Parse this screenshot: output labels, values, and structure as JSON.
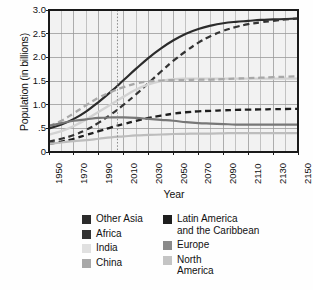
{
  "chart_data": {
    "type": "line",
    "title": "",
    "xlabel": "Year",
    "ylabel": "Population (in billions)",
    "xlim": [
      1950,
      2150
    ],
    "ylim": [
      0,
      3.0
    ],
    "grid": true,
    "legend_position": "bottom",
    "x_ticks": [
      "1950",
      "1970",
      "1990",
      "2010",
      "2030",
      "2050",
      "2070",
      "2090",
      "2110",
      "2130",
      "2150"
    ],
    "x_tick_values": [
      1950,
      1970,
      1990,
      2010,
      2030,
      2050,
      2070,
      2090,
      2110,
      2130,
      2150
    ],
    "x_minor_step": 10,
    "y_ticks": [
      "0",
      ".5",
      "1.0",
      "1.5",
      "2.0",
      "2.5",
      "3.0"
    ],
    "y_tick_values": [
      0,
      0.5,
      1.0,
      1.5,
      2.0,
      2.5,
      3.0
    ],
    "annotations": [
      {
        "name": "present-year-marker",
        "type": "vline",
        "x": 2005,
        "style": "dotted"
      }
    ],
    "x": [
      1950,
      1960,
      1970,
      1980,
      1990,
      2000,
      2010,
      2020,
      2030,
      2040,
      2050,
      2060,
      2070,
      2080,
      2090,
      2100,
      2110,
      2120,
      2130,
      2140,
      2150
    ],
    "series": [
      {
        "name": "Other Asia",
        "color": "#2b2b2b",
        "style": "solid",
        "width": 2.2,
        "values": [
          0.5,
          0.58,
          0.7,
          0.86,
          1.06,
          1.28,
          1.52,
          1.76,
          1.99,
          2.19,
          2.36,
          2.5,
          2.6,
          2.67,
          2.72,
          2.75,
          2.77,
          2.79,
          2.8,
          2.81,
          2.82
        ]
      },
      {
        "name": "Africa",
        "color": "#333333",
        "style": "dashed",
        "width": 2.2,
        "values": [
          0.22,
          0.28,
          0.36,
          0.47,
          0.62,
          0.8,
          1.0,
          1.22,
          1.46,
          1.7,
          1.93,
          2.13,
          2.31,
          2.45,
          2.56,
          2.64,
          2.7,
          2.74,
          2.77,
          2.8,
          2.82
        ]
      },
      {
        "name": "India",
        "color": "#d2d2d2",
        "style": "solid",
        "width": 2.4,
        "values": [
          0.37,
          0.44,
          0.55,
          0.69,
          0.85,
          1.01,
          1.17,
          1.32,
          1.43,
          1.5,
          1.54,
          1.55,
          1.55,
          1.55,
          1.55,
          1.55,
          1.55,
          1.55,
          1.55,
          1.55,
          1.55
        ]
      },
      {
        "name": "China",
        "color": "#a8a8a8",
        "style": "dashed",
        "width": 2.3,
        "values": [
          0.55,
          0.66,
          0.82,
          0.99,
          1.15,
          1.27,
          1.37,
          1.45,
          1.49,
          1.51,
          1.52,
          1.52,
          1.53,
          1.53,
          1.54,
          1.55,
          1.56,
          1.57,
          1.58,
          1.59,
          1.6
        ]
      },
      {
        "name": "Latin America\nand the Caribbean",
        "color": "#1e1e1e",
        "style": "dashed",
        "width": 2.3,
        "values": [
          0.17,
          0.22,
          0.28,
          0.36,
          0.44,
          0.52,
          0.59,
          0.66,
          0.72,
          0.77,
          0.81,
          0.84,
          0.86,
          0.87,
          0.88,
          0.89,
          0.895,
          0.9,
          0.905,
          0.908,
          0.91
        ]
      },
      {
        "name": "Europe",
        "color": "#777777",
        "style": "solid",
        "width": 2.2,
        "values": [
          0.55,
          0.61,
          0.66,
          0.69,
          0.72,
          0.73,
          0.73,
          0.72,
          0.7,
          0.68,
          0.66,
          0.63,
          0.61,
          0.6,
          0.59,
          0.58,
          0.58,
          0.58,
          0.58,
          0.58,
          0.58
        ]
      },
      {
        "name": "North\nAmerica",
        "color": "#bdbdbd",
        "style": "solid",
        "width": 2.2,
        "values": [
          0.17,
          0.2,
          0.23,
          0.25,
          0.28,
          0.31,
          0.33,
          0.35,
          0.36,
          0.37,
          0.38,
          0.385,
          0.39,
          0.39,
          0.395,
          0.4,
          0.4,
          0.4,
          0.4,
          0.4,
          0.4
        ]
      }
    ]
  },
  "axes": {
    "y_title": "Population (in billions)",
    "x_title": "Year"
  },
  "legend": {
    "columns": [
      {
        "name": "legend-column-left",
        "entries": [
          {
            "label": "Other Asia",
            "color": "#2b2b2b"
          },
          {
            "label": "Africa",
            "color": "#333333"
          },
          {
            "label": "India",
            "color": "#e0e0e0"
          },
          {
            "label": "China",
            "color": "#a8a8a8"
          }
        ]
      },
      {
        "name": "legend-column-right",
        "entries": [
          {
            "label": "Latin America\nand the Caribbean",
            "color": "#1e1e1e"
          },
          {
            "label": "Europe",
            "color": "#8a8a8a"
          },
          {
            "label": "North\nAmerica",
            "color": "#c4c4c4"
          }
        ]
      }
    ]
  },
  "style": {
    "plot_bg": "#f2f2f2",
    "grid_color": "#9a9a9a",
    "frame_color": "#1a1a1a",
    "marker_line_color": "#8a8a8a"
  }
}
